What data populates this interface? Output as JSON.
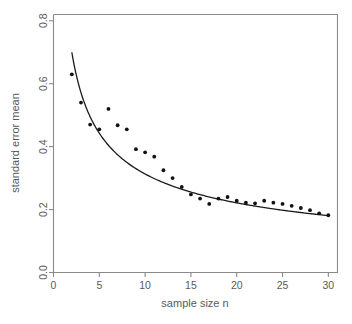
{
  "chart_data": {
    "type": "scatter",
    "title": "",
    "subtitle": "",
    "xlabel": "sample size n",
    "ylabel": "standard error mean",
    "xlim": [
      0,
      31
    ],
    "ylim": [
      0.0,
      0.82
    ],
    "grid": false,
    "legend": null,
    "x_ticks": [
      0,
      5,
      10,
      15,
      20,
      25,
      30
    ],
    "x_tick_labels": [
      "0",
      "5",
      "10",
      "15",
      "20",
      "25",
      "30"
    ],
    "y_ticks": [
      0.0,
      0.2,
      0.4,
      0.6,
      0.8
    ],
    "y_tick_labels": [
      "0.0",
      "0.2",
      "0.4",
      "0.6",
      "0.8"
    ],
    "series": [
      {
        "name": "observed standard error of the mean",
        "type": "scatter",
        "marker": "filled-circle",
        "color": "#111111",
        "x": [
          2,
          3,
          4,
          5,
          6,
          7,
          8,
          9,
          10,
          11,
          12,
          13,
          14,
          15,
          16,
          17,
          18,
          19,
          20,
          21,
          22,
          23,
          24,
          25,
          26,
          27,
          28,
          29,
          30
        ],
        "y": [
          0.63,
          0.54,
          0.47,
          0.455,
          0.52,
          0.468,
          0.455,
          0.392,
          0.382,
          0.368,
          0.325,
          0.3,
          0.272,
          0.248,
          0.235,
          0.218,
          0.235,
          0.24,
          0.228,
          0.222,
          0.22,
          0.228,
          0.222,
          0.218,
          0.212,
          0.205,
          0.198,
          0.188,
          0.182
        ]
      },
      {
        "name": "theoretical fit",
        "type": "line",
        "color": "#1a1a1a",
        "formula": "c / sqrt(n)",
        "c": 0.99,
        "x_start": 2,
        "x_end": 30,
        "y_start": 0.7,
        "y_end": 0.185
      }
    ]
  },
  "axes": {
    "x_title": "sample size n",
    "y_title": "standard error mean"
  }
}
